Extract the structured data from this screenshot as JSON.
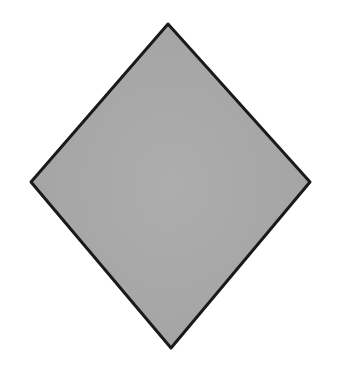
{
  "diagram": {
    "shape": "diamond",
    "vertices": {
      "top": [
        168,
        24
      ],
      "right": [
        310,
        182
      ],
      "bottom": [
        171,
        348
      ],
      "left": [
        31,
        182
      ]
    },
    "fill_color": "#a9a9a9",
    "stroke_color": "#1a1a1a",
    "stroke_width": 3,
    "background_color": "#ffffff"
  }
}
